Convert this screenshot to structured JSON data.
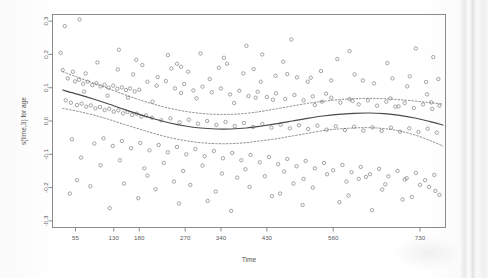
{
  "chart_data": {
    "type": "scatter",
    "title": "",
    "xlabel": "Time",
    "ylabel": "s(time,3) for age",
    "xlim": [
      10,
      780
    ],
    "ylim": [
      -0.32,
      0.32
    ],
    "grid": false,
    "legend": "none",
    "x_ticks": [
      55,
      130,
      180,
      270,
      340,
      430,
      560,
      730
    ],
    "x_tick_labels": [
      "55",
      "130",
      "180",
      "270",
      "340",
      "430",
      "560",
      "730"
    ],
    "y_ticks": [
      0.3,
      0.2,
      0.1,
      0.0,
      -0.1,
      -0.2,
      -0.3
    ],
    "y_tick_labels": [
      "0.3",
      "0.2",
      "0.1",
      "0.0",
      "-0.1",
      "-0.2",
      "-0.3"
    ],
    "marker": "open-circle",
    "point_color": "#777777",
    "fit_color": "#4a4a4a",
    "ci_color": "#6e6e6e",
    "series": [
      {
        "name": "fit",
        "style": "solid",
        "x": [
          30,
          60,
          90,
          120,
          150,
          180,
          210,
          240,
          270,
          300,
          330,
          360,
          390,
          420,
          450,
          480,
          510,
          540,
          570,
          600,
          630,
          660,
          690,
          720,
          750,
          775
        ],
        "values": [
          0.093,
          0.08,
          0.066,
          0.051,
          0.035,
          0.02,
          0.006,
          -0.006,
          -0.015,
          -0.021,
          -0.024,
          -0.024,
          -0.021,
          -0.015,
          -0.008,
          0.0,
          0.008,
          0.015,
          0.02,
          0.023,
          0.024,
          0.022,
          0.017,
          0.009,
          -0.002,
          -0.012
        ]
      },
      {
        "name": "upper-ci",
        "style": "dashed",
        "x": [
          30,
          60,
          90,
          120,
          150,
          180,
          210,
          240,
          270,
          300,
          330,
          360,
          390,
          420,
          450,
          480,
          510,
          540,
          570,
          600,
          630,
          660,
          690,
          720,
          750,
          775
        ],
        "values": [
          0.148,
          0.131,
          0.114,
          0.097,
          0.08,
          0.064,
          0.05,
          0.038,
          0.029,
          0.023,
          0.02,
          0.02,
          0.023,
          0.029,
          0.037,
          0.045,
          0.053,
          0.059,
          0.064,
          0.067,
          0.068,
          0.067,
          0.064,
          0.06,
          0.055,
          0.051
        ]
      },
      {
        "name": "lower-ci",
        "style": "dashed",
        "x": [
          30,
          60,
          90,
          120,
          150,
          180,
          210,
          240,
          270,
          300,
          330,
          360,
          390,
          420,
          450,
          480,
          510,
          540,
          570,
          600,
          630,
          660,
          690,
          720,
          750,
          775
        ],
        "values": [
          0.038,
          0.029,
          0.018,
          0.005,
          -0.01,
          -0.024,
          -0.038,
          -0.05,
          -0.059,
          -0.065,
          -0.068,
          -0.068,
          -0.065,
          -0.059,
          -0.053,
          -0.045,
          -0.037,
          -0.029,
          -0.024,
          -0.021,
          -0.02,
          -0.023,
          -0.03,
          -0.042,
          -0.059,
          -0.075
        ]
      }
    ],
    "points": [
      [
        34,
        0.285
      ],
      [
        63,
        0.305
      ],
      [
        236,
        0.198
      ],
      [
        300,
        0.203
      ],
      [
        421,
        0.2
      ],
      [
        478,
        0.245
      ],
      [
        30,
        0.153
      ],
      [
        50,
        0.148
      ],
      [
        75,
        0.143
      ],
      [
        138,
        0.155
      ],
      [
        168,
        0.14
      ],
      [
        186,
        0.168
      ],
      [
        243,
        0.158
      ],
      [
        262,
        0.163
      ],
      [
        276,
        0.148
      ],
      [
        336,
        0.16
      ],
      [
        352,
        0.172
      ],
      [
        384,
        0.143
      ],
      [
        404,
        0.156
      ],
      [
        447,
        0.136
      ],
      [
        470,
        0.141
      ],
      [
        489,
        0.131
      ],
      [
        510,
        0.118
      ],
      [
        536,
        0.15
      ],
      [
        556,
        0.122
      ],
      [
        602,
        0.14
      ],
      [
        640,
        0.113
      ],
      [
        676,
        0.128
      ],
      [
        705,
        0.104
      ],
      [
        742,
        0.117
      ],
      [
        40,
        0.128
      ],
      [
        54,
        0.119
      ],
      [
        62,
        0.124
      ],
      [
        70,
        0.112
      ],
      [
        79,
        0.118
      ],
      [
        88,
        0.108
      ],
      [
        96,
        0.114
      ],
      [
        104,
        0.104
      ],
      [
        112,
        0.109
      ],
      [
        120,
        0.1
      ],
      [
        129,
        0.106
      ],
      [
        137,
        0.097
      ],
      [
        146,
        0.101
      ],
      [
        154,
        0.093
      ],
      [
        162,
        0.098
      ],
      [
        171,
        0.089
      ],
      [
        180,
        0.094
      ],
      [
        196,
        0.118
      ],
      [
        214,
        0.106
      ],
      [
        232,
        0.12
      ],
      [
        250,
        0.098
      ],
      [
        268,
        0.111
      ],
      [
        286,
        0.092
      ],
      [
        304,
        0.103
      ],
      [
        322,
        0.086
      ],
      [
        340,
        0.098
      ],
      [
        358,
        0.08
      ],
      [
        376,
        0.091
      ],
      [
        394,
        0.075
      ],
      [
        412,
        0.088
      ],
      [
        430,
        0.072
      ],
      [
        448,
        0.083
      ],
      [
        466,
        0.066
      ],
      [
        484,
        0.078
      ],
      [
        502,
        0.062
      ],
      [
        520,
        0.074
      ],
      [
        538,
        0.058
      ],
      [
        556,
        0.07
      ],
      [
        574,
        0.055
      ],
      [
        592,
        0.066
      ],
      [
        610,
        0.05
      ],
      [
        628,
        0.062
      ],
      [
        646,
        0.046
      ],
      [
        664,
        0.058
      ],
      [
        682,
        0.043
      ],
      [
        700,
        0.054
      ],
      [
        718,
        0.039
      ],
      [
        736,
        0.05
      ],
      [
        754,
        0.036
      ],
      [
        768,
        0.046
      ],
      [
        36,
        0.062
      ],
      [
        46,
        0.055
      ],
      [
        58,
        0.048
      ],
      [
        67,
        0.052
      ],
      [
        76,
        0.043
      ],
      [
        85,
        0.047
      ],
      [
        94,
        0.038
      ],
      [
        103,
        0.042
      ],
      [
        112,
        0.033
      ],
      [
        121,
        0.037
      ],
      [
        130,
        0.028
      ],
      [
        139,
        0.032
      ],
      [
        148,
        0.023
      ],
      [
        157,
        0.027
      ],
      [
        166,
        0.018
      ],
      [
        175,
        0.022
      ],
      [
        184,
        0.013
      ],
      [
        193,
        0.017
      ],
      [
        205,
        0.01
      ],
      [
        223,
        0.002
      ],
      [
        241,
        0.008
      ],
      [
        259,
        -0.004
      ],
      [
        277,
        0.004
      ],
      [
        295,
        -0.008
      ],
      [
        313,
        0.0
      ],
      [
        331,
        -0.012
      ],
      [
        349,
        -0.003
      ],
      [
        367,
        -0.015
      ],
      [
        385,
        -0.006
      ],
      [
        403,
        -0.018
      ],
      [
        421,
        -0.009
      ],
      [
        439,
        -0.02
      ],
      [
        457,
        -0.011
      ],
      [
        475,
        -0.022
      ],
      [
        493,
        -0.013
      ],
      [
        511,
        -0.024
      ],
      [
        529,
        -0.014
      ],
      [
        547,
        -0.026
      ],
      [
        565,
        -0.016
      ],
      [
        583,
        -0.027
      ],
      [
        601,
        -0.017
      ],
      [
        619,
        -0.029
      ],
      [
        637,
        -0.019
      ],
      [
        655,
        -0.03
      ],
      [
        673,
        -0.02
      ],
      [
        691,
        -0.032
      ],
      [
        709,
        -0.022
      ],
      [
        727,
        -0.033
      ],
      [
        745,
        -0.023
      ],
      [
        763,
        -0.035
      ],
      [
        48,
        -0.055
      ],
      [
        92,
        -0.068
      ],
      [
        110,
        -0.052
      ],
      [
        128,
        -0.075
      ],
      [
        146,
        -0.06
      ],
      [
        164,
        -0.082
      ],
      [
        182,
        -0.066
      ],
      [
        200,
        -0.088
      ],
      [
        218,
        -0.072
      ],
      [
        236,
        -0.094
      ],
      [
        254,
        -0.078
      ],
      [
        272,
        -0.1
      ],
      [
        290,
        -0.084
      ],
      [
        308,
        -0.106
      ],
      [
        326,
        -0.09
      ],
      [
        344,
        -0.112
      ],
      [
        362,
        -0.096
      ],
      [
        380,
        -0.118
      ],
      [
        398,
        -0.102
      ],
      [
        416,
        -0.124
      ],
      [
        434,
        -0.108
      ],
      [
        452,
        -0.13
      ],
      [
        470,
        -0.114
      ],
      [
        488,
        -0.136
      ],
      [
        506,
        -0.12
      ],
      [
        524,
        -0.142
      ],
      [
        542,
        -0.126
      ],
      [
        560,
        -0.148
      ],
      [
        578,
        -0.132
      ],
      [
        596,
        -0.154
      ],
      [
        614,
        -0.138
      ],
      [
        632,
        -0.16
      ],
      [
        650,
        -0.144
      ],
      [
        668,
        -0.166
      ],
      [
        686,
        -0.15
      ],
      [
        704,
        -0.172
      ],
      [
        722,
        -0.156
      ],
      [
        740,
        -0.178
      ],
      [
        758,
        -0.162
      ],
      [
        66,
        -0.11
      ],
      [
        104,
        -0.133
      ],
      [
        142,
        -0.118
      ],
      [
        190,
        -0.142
      ],
      [
        228,
        -0.126
      ],
      [
        266,
        -0.15
      ],
      [
        304,
        -0.134
      ],
      [
        342,
        -0.158
      ],
      [
        388,
        -0.145
      ],
      [
        426,
        -0.166
      ],
      [
        464,
        -0.152
      ],
      [
        502,
        -0.174
      ],
      [
        548,
        -0.16
      ],
      [
        586,
        -0.182
      ],
      [
        624,
        -0.168
      ],
      [
        662,
        -0.19
      ],
      [
        700,
        -0.176
      ],
      [
        748,
        -0.198
      ],
      [
        84,
        -0.196
      ],
      [
        150,
        -0.188
      ],
      [
        212,
        -0.205
      ],
      [
        280,
        -0.192
      ],
      [
        330,
        -0.212
      ],
      [
        396,
        -0.198
      ],
      [
        456,
        -0.218
      ],
      [
        520,
        -0.2
      ],
      [
        590,
        -0.224
      ],
      [
        656,
        -0.206
      ],
      [
        714,
        -0.228
      ],
      [
        760,
        -0.21
      ],
      [
        122,
        -0.262
      ],
      [
        258,
        -0.248
      ],
      [
        360,
        -0.27
      ],
      [
        500,
        -0.252
      ],
      [
        636,
        -0.268
      ],
      [
        44,
        -0.218
      ],
      [
        178,
        -0.232
      ],
      [
        314,
        -0.24
      ],
      [
        440,
        -0.226
      ],
      [
        572,
        -0.244
      ],
      [
        696,
        -0.236
      ],
      [
        768,
        -0.222
      ],
      [
        58,
        -0.178
      ],
      [
        196,
        -0.164
      ],
      [
        248,
        -0.182
      ],
      [
        372,
        -0.17
      ],
      [
        482,
        -0.188
      ],
      [
        610,
        -0.174
      ],
      [
        730,
        -0.192
      ],
      [
        158,
        0.07
      ],
      [
        206,
        0.058
      ],
      [
        292,
        0.068
      ],
      [
        366,
        0.054
      ],
      [
        442,
        0.064
      ],
      [
        524,
        0.048
      ],
      [
        598,
        0.06
      ],
      [
        688,
        0.044
      ],
      [
        752,
        0.056
      ],
      [
        72,
        0.088
      ],
      [
        118,
        0.076
      ],
      [
        262,
        0.084
      ],
      [
        408,
        0.07
      ],
      [
        546,
        0.082
      ],
      [
        672,
        0.068
      ],
      [
        744,
        0.08
      ],
      [
        216,
        0.132
      ],
      [
        318,
        0.126
      ],
      [
        418,
        0.118
      ],
      [
        516,
        0.13
      ],
      [
        618,
        0.122
      ],
      [
        710,
        0.134
      ],
      [
        766,
        0.126
      ],
      [
        98,
        0.176
      ],
      [
        174,
        0.184
      ],
      [
        254,
        0.172
      ],
      [
        346,
        0.19
      ],
      [
        462,
        0.178
      ],
      [
        568,
        0.186
      ],
      [
        666,
        0.174
      ],
      [
        756,
        0.192
      ],
      [
        26,
        0.205
      ],
      [
        140,
        0.214
      ],
      [
        390,
        0.226
      ],
      [
        592,
        0.21
      ],
      [
        722,
        0.218
      ]
    ]
  }
}
